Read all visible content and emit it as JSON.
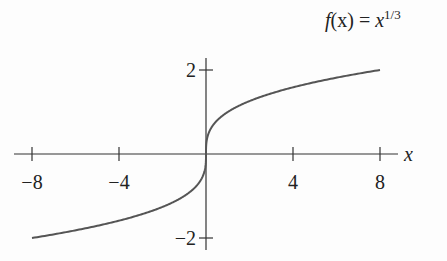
{
  "chart_data": {
    "type": "line",
    "function_label": {
      "lhs": "f",
      "arg": "(x)",
      "eq": " = ",
      "base": "x",
      "exponent": "1/3"
    },
    "xlabel": "x",
    "ylabel": "",
    "xlim": [
      -8.5,
      8.5
    ],
    "ylim": [
      -2.2,
      2.2
    ],
    "x_ticks": [
      -8,
      -4,
      4,
      8
    ],
    "x_tick_labels": [
      "−8",
      "−4",
      "4",
      "8"
    ],
    "y_ticks": [
      -2,
      2
    ],
    "y_tick_labels": [
      "−2",
      "2"
    ],
    "grid": false,
    "legend": "none",
    "series": [
      {
        "name": "f(x) = x^(1/3)",
        "color": "#555555",
        "x": [
          -8,
          -6,
          -4,
          -2,
          -1,
          -0.5,
          -0.1,
          -0.01,
          0,
          0.01,
          0.1,
          0.5,
          1,
          2,
          4,
          6,
          8
        ],
        "y": [
          -2,
          -1.817,
          -1.587,
          -1.26,
          -1,
          -0.794,
          -0.464,
          -0.215,
          0,
          0.215,
          0.464,
          0.794,
          1,
          1.26,
          1.587,
          1.817,
          2
        ]
      }
    ]
  },
  "colors": {
    "axis": "#333333",
    "curve": "#555555",
    "text": "#222222"
  }
}
